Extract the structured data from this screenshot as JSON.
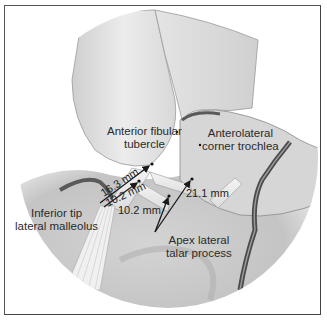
{
  "figure": {
    "labels": {
      "anterior_fibular_tubercle": [
        "Anterior fibular",
        "tubercle"
      ],
      "anterolateral_corner": [
        "Anterolateral",
        "corner trochlea"
      ],
      "inferior_tip": [
        "Inferior tip",
        "lateral malleolus"
      ],
      "apex_talar": [
        "Apex lateral",
        "talar process"
      ]
    },
    "measurements": {
      "m1": "16.3 mm",
      "m2": "10.2 mm",
      "m3": "10.2 mm",
      "m4": "21.1 mm"
    },
    "colors": {
      "border": "#555555",
      "background": "#ffffff",
      "bone_light": "#e6e6e6",
      "bone_mid": "#b8b8b8",
      "shadow": "#6e6e6e",
      "arrow": "#1a1a1a"
    }
  }
}
